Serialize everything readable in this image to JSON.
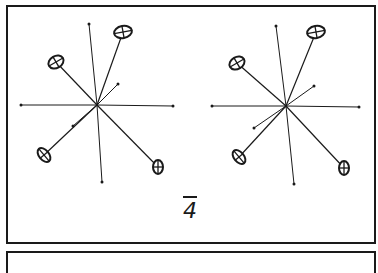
{
  "figure": {
    "type": "stereo-pair",
    "symmetry_label": "4",
    "symmetry_label_overbar": true,
    "colors": {
      "ink": "#1a1a1a",
      "background": "#ffffff"
    },
    "views": [
      {
        "name": "left",
        "center": [
          97,
          105
        ],
        "bonds_to_points": [
          [
            21,
            105
          ],
          [
            173,
            106
          ],
          [
            89,
            24
          ],
          [
            102,
            182
          ],
          [
            118,
            84
          ],
          [
            73,
            126
          ]
        ],
        "ellipsoids": [
          {
            "pos": [
              123,
              32
            ],
            "rx": 9,
            "ry": 6,
            "rot": -10
          },
          {
            "pos": [
              56,
              62
            ],
            "rx": 8,
            "ry": 6,
            "rot": -30
          },
          {
            "pos": [
              44,
              155
            ],
            "rx": 5,
            "ry": 8,
            "rot": -40
          },
          {
            "pos": [
              158,
              167
            ],
            "rx": 5,
            "ry": 7,
            "rot": 0
          }
        ]
      },
      {
        "name": "right",
        "center": [
          286,
          106
        ],
        "bonds_to_points": [
          [
            212,
            106
          ],
          [
            359,
            107
          ],
          [
            276,
            26
          ],
          [
            294,
            184
          ],
          [
            314,
            86
          ],
          [
            254,
            128
          ]
        ],
        "ellipsoids": [
          {
            "pos": [
              316,
              32
            ],
            "rx": 9,
            "ry": 6,
            "rot": -10
          },
          {
            "pos": [
              237,
              63
            ],
            "rx": 8,
            "ry": 6,
            "rot": -30
          },
          {
            "pos": [
              239,
              157
            ],
            "rx": 5,
            "ry": 8,
            "rot": -40
          },
          {
            "pos": [
              344,
              168
            ],
            "rx": 5,
            "ry": 7,
            "rot": 0
          }
        ]
      }
    ]
  }
}
